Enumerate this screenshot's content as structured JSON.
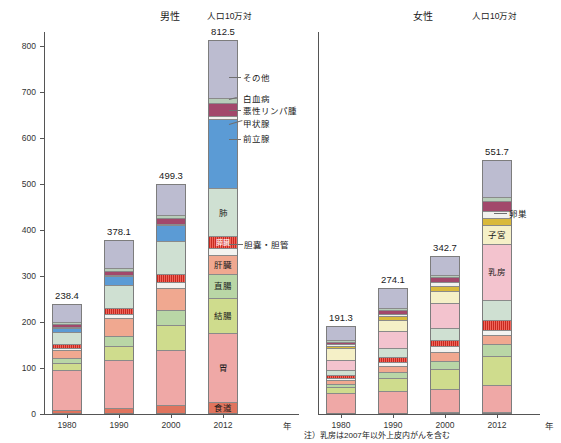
{
  "figure": {
    "male_title": "男性",
    "female_title": "女性",
    "unit": "人口10万対",
    "x_axis_unit": "年",
    "footnote": "注）乳房は2007年以外上皮内がんを含む"
  },
  "axis": {
    "y_ticks": [
      "0",
      "100",
      "200",
      "300",
      "400",
      "500",
      "600",
      "700",
      "800"
    ],
    "y_min": 0,
    "y_max": 830,
    "x_categories": [
      "1980",
      "1990",
      "2000",
      "2012"
    ]
  },
  "colors": {
    "esophagus": "#e0745e",
    "stomach": "#efa8a6",
    "colon": "#cfdc8d",
    "rectum": "#b9d6a6",
    "liver": "#f0a890",
    "gallbladder": "#f3f3f0",
    "pancreas": "#d3312a",
    "lung": "#cfe0d2",
    "prostate": "#5b9bd5",
    "thyroid": "#f2f2ef",
    "lymphoma": "#a2486b",
    "leukemia": "#b7cdb9",
    "other": "#bcbcd0",
    "breast": "#f3c3ce",
    "uterus": "#f5f0c7",
    "ovary": "#d9b93b"
  },
  "chart_data": {
    "type": "bar",
    "subtype": "stacked-column",
    "xlabel": "年",
    "ylabel": "人口10万対",
    "ylim": [
      0,
      830
    ],
    "grid": false,
    "legend": "inline-segment-labels",
    "categories": [
      "1980",
      "1990",
      "2000",
      "2012"
    ],
    "panels": [
      {
        "name": "male",
        "title": "男性",
        "totals": [
          "238.4",
          "378.1",
          "499.3",
          "812.5"
        ],
        "total_values": [
          238.4,
          378.1,
          499.3,
          812.5
        ],
        "series": [
          {
            "name": "食道",
            "label": "食道",
            "color": "#e0745e",
            "values": [
              8.0,
              12.0,
              19.0,
              27.0
            ]
          },
          {
            "name": "胃",
            "label": "胃",
            "color": "#efa8a6",
            "values": [
              88.0,
              105.0,
              119.0,
              148.0
            ]
          },
          {
            "name": "結腸",
            "label": "結腸",
            "color": "#cfdc8d",
            "values": [
              14.0,
              31.0,
              56.0,
              78.0
            ]
          },
          {
            "name": "直腸",
            "label": "直腸",
            "color": "#b9d6a6",
            "values": [
              12.0,
              22.0,
              33.0,
              51.0
            ]
          },
          {
            "name": "肝臓",
            "label": "肝臓",
            "color": "#f0a890",
            "values": [
              17.0,
              38.0,
              47.0,
              42.0
            ]
          },
          {
            "name": "胆嚢・胆管",
            "label": "胆嚢・胆管",
            "color": "#f3f3f0",
            "values": [
              5.0,
              9.0,
              13.0,
              15.0
            ]
          },
          {
            "name": "膵臓",
            "label": "膵臓",
            "color": "#d3312a",
            "values": [
              8.0,
              13.0,
              17.0,
              25.0
            ]
          },
          {
            "name": "肺",
            "label": "肺",
            "color": "#cfe0d2",
            "values": [
              26.0,
              51.0,
              71.0,
              104.0
            ]
          },
          {
            "name": "前立腺",
            "label": "前立腺",
            "color": "#5b9bd5",
            "values": [
              10.0,
              18.0,
              35.0,
              150.0
            ]
          },
          {
            "name": "甲状腺",
            "label": "甲状腺",
            "color": "#f2f2ef",
            "values": [
              2.0,
              3.0,
              3.0,
              8.0
            ]
          },
          {
            "name": "悪性リンパ腫",
            "label": "悪性リンパ腫",
            "color": "#a2486b",
            "values": [
              5.0,
              9.0,
              13.0,
              28.0
            ]
          },
          {
            "name": "白血病",
            "label": "白血病",
            "color": "#b7cdb9",
            "values": [
              5.0,
              6.0,
              7.0,
              11.0
            ]
          },
          {
            "name": "その他",
            "label": "その他",
            "color": "#bcbcd0",
            "values": [
              38.4,
              61.1,
              66.3,
              125.5
            ]
          }
        ]
      },
      {
        "name": "female",
        "title": "女性",
        "totals": [
          "191.3",
          "274.1",
          "342.7",
          "551.7"
        ],
        "total_values": [
          191.3,
          274.1,
          342.7,
          551.7
        ],
        "series": [
          {
            "name": "食道",
            "label": "食道",
            "color": "#e0745e",
            "values": [
              2.0,
              3.0,
              4.0,
              5.0
            ]
          },
          {
            "name": "胃",
            "label": "胃",
            "color": "#efa8a6",
            "values": [
              44.0,
              48.0,
              50.0,
              57.0
            ]
          },
          {
            "name": "結腸",
            "label": "結腸",
            "color": "#cfdc8d",
            "values": [
              13.0,
              28.0,
              44.0,
              64.0
            ]
          },
          {
            "name": "直腸",
            "label": "直腸",
            "color": "#b9d6a6",
            "values": [
              7.0,
              12.0,
              18.0,
              27.0
            ]
          },
          {
            "name": "肝臓",
            "label": "肝臓",
            "color": "#f0a890",
            "values": [
              7.0,
              14.0,
              19.0,
              18.0
            ]
          },
          {
            "name": "胆嚢・胆管",
            "label": "胆嚢・胆管",
            "color": "#f3f3f0",
            "values": [
              5.0,
              9.0,
              12.0,
              12.0
            ]
          },
          {
            "name": "膵臓",
            "label": "膵臓",
            "color": "#d3312a",
            "values": [
              6.0,
              9.0,
              13.0,
              22.0
            ]
          },
          {
            "name": "肺",
            "label": "肺",
            "color": "#cfe0d2",
            "values": [
              12.0,
              20.0,
              27.0,
              43.0
            ]
          },
          {
            "name": "乳房",
            "label": "乳房",
            "color": "#f3c3ce",
            "values": [
              22.0,
              37.0,
              55.0,
              122.0
            ]
          },
          {
            "name": "子宮",
            "label": "子宮",
            "color": "#f5f0c7",
            "values": [
              25.0,
              24.0,
              26.0,
              41.0
            ]
          },
          {
            "name": "卵巣",
            "label": "卵巣",
            "color": "#d9b93b",
            "values": [
              5.0,
              8.0,
              11.0,
              14.0
            ]
          },
          {
            "name": "甲状腺",
            "label": "甲状腺",
            "color": "#f2f2ef",
            "values": [
              4.0,
              6.0,
              8.0,
              16.0
            ]
          },
          {
            "name": "悪性リンパ腫",
            "label": "悪性リンパ腫",
            "color": "#a2486b",
            "values": [
              4.0,
              7.0,
              10.0,
              22.0
            ]
          },
          {
            "name": "白血病",
            "label": "白血病",
            "color": "#b7cdb9",
            "values": [
              4.0,
              5.0,
              5.0,
              8.0
            ]
          },
          {
            "name": "その他",
            "label": "その他",
            "color": "#bcbcd0",
            "values": [
              31.3,
              44.1,
              40.7,
              80.7
            ]
          }
        ]
      }
    ]
  },
  "male_callouts": [
    {
      "label": "その他"
    },
    {
      "label": "白血病"
    },
    {
      "label": "悪性リンパ腫"
    },
    {
      "label": "甲状腺"
    },
    {
      "label": "前立腺"
    },
    {
      "label": "胆嚢・胆管"
    }
  ],
  "male_inline_labels": [
    "肺",
    "膵臓",
    "肝臓",
    "直腸",
    "結腸",
    "胃",
    "食道"
  ],
  "female_callouts": [
    {
      "label": "卵巣"
    }
  ],
  "female_inline_labels": [
    "子宮",
    "乳房"
  ]
}
